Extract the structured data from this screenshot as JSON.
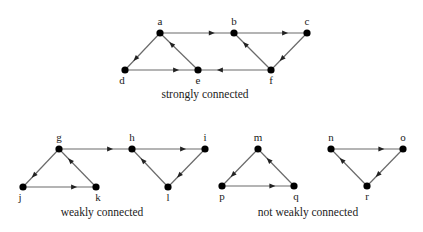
{
  "diagram": {
    "type": "directed-graphs",
    "groups": [
      {
        "caption": "strongly connected",
        "caption_pos": [
          205,
          98
        ],
        "nodes": [
          {
            "id": "a",
            "x": 160,
            "y": 33,
            "label_dx": 0,
            "label_dy": -8
          },
          {
            "id": "b",
            "x": 234,
            "y": 33,
            "label_dx": 0,
            "label_dy": -8
          },
          {
            "id": "c",
            "x": 307,
            "y": 33,
            "label_dx": 0,
            "label_dy": -8
          },
          {
            "id": "d",
            "x": 125,
            "y": 70,
            "label_dx": -3,
            "label_dy": 14
          },
          {
            "id": "e",
            "x": 198,
            "y": 70,
            "label_dx": 0,
            "label_dy": 14
          },
          {
            "id": "f",
            "x": 271,
            "y": 70,
            "label_dx": 0,
            "label_dy": 14
          }
        ],
        "edges": [
          {
            "from": "a",
            "to": "d"
          },
          {
            "from": "d",
            "to": "e"
          },
          {
            "from": "e",
            "to": "a"
          },
          {
            "from": "a",
            "to": "b"
          },
          {
            "from": "b",
            "to": "c"
          },
          {
            "from": "c",
            "to": "f"
          },
          {
            "from": "f",
            "to": "b"
          },
          {
            "from": "f",
            "to": "e"
          }
        ]
      },
      {
        "caption": "weakly connected",
        "caption_pos": [
          102,
          216
        ],
        "nodes": [
          {
            "id": "g",
            "x": 59,
            "y": 149,
            "label_dx": 0,
            "label_dy": -8
          },
          {
            "id": "h",
            "x": 132,
            "y": 149,
            "label_dx": 0,
            "label_dy": -8
          },
          {
            "id": "i",
            "x": 205,
            "y": 149,
            "label_dx": 0,
            "label_dy": -8
          },
          {
            "id": "j",
            "x": 23,
            "y": 187,
            "label_dx": -3,
            "label_dy": 14
          },
          {
            "id": "k",
            "x": 96,
            "y": 187,
            "label_dx": 2,
            "label_dy": 14
          },
          {
            "id": "l",
            "x": 168,
            "y": 187,
            "label_dx": 0,
            "label_dy": 14
          }
        ],
        "edges": [
          {
            "from": "g",
            "to": "j"
          },
          {
            "from": "j",
            "to": "k"
          },
          {
            "from": "k",
            "to": "g"
          },
          {
            "from": "g",
            "to": "h"
          },
          {
            "from": "h",
            "to": "i"
          },
          {
            "from": "i",
            "to": "l"
          },
          {
            "from": "l",
            "to": "h"
          }
        ]
      },
      {
        "caption": "not weakly connected",
        "caption_pos": [
          308,
          216
        ],
        "nodes": [
          {
            "id": "m",
            "x": 258,
            "y": 149,
            "label_dx": 0,
            "label_dy": -8
          },
          {
            "id": "n",
            "x": 331,
            "y": 149,
            "label_dx": 0,
            "label_dy": -8
          },
          {
            "id": "o",
            "x": 403,
            "y": 149,
            "label_dx": 0,
            "label_dy": -8
          },
          {
            "id": "p",
            "x": 222,
            "y": 186,
            "label_dx": 0,
            "label_dy": 14
          },
          {
            "id": "q",
            "x": 294,
            "y": 186,
            "label_dx": 2,
            "label_dy": 14
          },
          {
            "id": "r",
            "x": 367,
            "y": 186,
            "label_dx": 0,
            "label_dy": 14
          }
        ],
        "edges": [
          {
            "from": "m",
            "to": "p"
          },
          {
            "from": "p",
            "to": "q"
          },
          {
            "from": "q",
            "to": "m"
          },
          {
            "from": "n",
            "to": "o"
          },
          {
            "from": "o",
            "to": "r"
          },
          {
            "from": "r",
            "to": "n"
          }
        ]
      }
    ]
  }
}
